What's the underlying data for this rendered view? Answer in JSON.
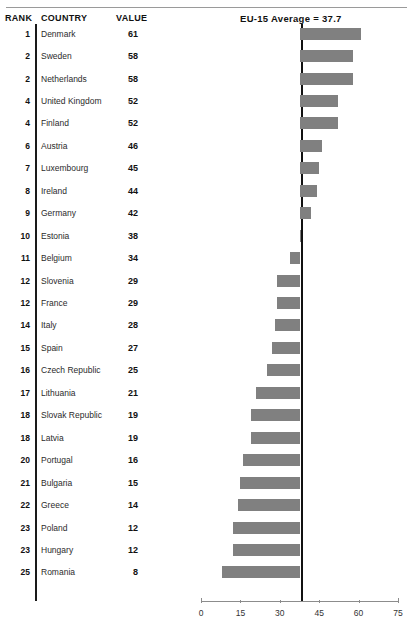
{
  "table": {
    "headers": {
      "rank": "RANK",
      "country": "COUNTRY",
      "value": "VALUE"
    }
  },
  "annotation": {
    "average_label": "EU-15 Average = 37.7"
  },
  "chart_data": {
    "type": "bar",
    "orientation": "horizontal",
    "title": "",
    "subtitle": "",
    "xlabel": "",
    "ylabel": "",
    "xlim": [
      0,
      75
    ],
    "xticks": [
      0,
      15,
      30,
      45,
      60,
      75
    ],
    "xtick_labels": [
      "0",
      "15",
      "30",
      "45",
      "60",
      "75"
    ],
    "grid": false,
    "legend": false,
    "bar_color": "#808080",
    "reference_line": {
      "label": "EU-15 Average = 37.7",
      "value": 37.7,
      "color": "#111111"
    },
    "bars_anchored_at_reference_line": true,
    "categories": [
      "Denmark",
      "Sweden",
      "Netherlands",
      "United Kingdom",
      "Finland",
      "Austria",
      "Luxembourg",
      "Ireland",
      "Germany",
      "Estonia",
      "Belgium",
      "Slovenia",
      "France",
      "Italy",
      "Spain",
      "Czech Republic",
      "Lithuania",
      "Slovak Republic",
      "Latvia",
      "Portugal",
      "Bulgaria",
      "Greece",
      "Poland",
      "Hungary",
      "Romania"
    ],
    "values": [
      61,
      58,
      58,
      52,
      52,
      46,
      45,
      44,
      42,
      38,
      34,
      29,
      29,
      28,
      27,
      25,
      21,
      19,
      19,
      16,
      15,
      14,
      12,
      12,
      8
    ],
    "ranks": [
      1,
      2,
      2,
      4,
      4,
      6,
      7,
      8,
      9,
      10,
      11,
      12,
      12,
      14,
      15,
      16,
      17,
      18,
      18,
      20,
      21,
      22,
      23,
      23,
      25
    ],
    "rows": [
      {
        "rank": "1",
        "country": "Denmark",
        "value": "61"
      },
      {
        "rank": "2",
        "country": "Sweden",
        "value": "58"
      },
      {
        "rank": "2",
        "country": "Netherlands",
        "value": "58"
      },
      {
        "rank": "4",
        "country": "United Kingdom",
        "value": "52"
      },
      {
        "rank": "4",
        "country": "Finland",
        "value": "52"
      },
      {
        "rank": "6",
        "country": "Austria",
        "value": "46"
      },
      {
        "rank": "7",
        "country": "Luxembourg",
        "value": "45"
      },
      {
        "rank": "8",
        "country": "Ireland",
        "value": "44"
      },
      {
        "rank": "9",
        "country": "Germany",
        "value": "42"
      },
      {
        "rank": "10",
        "country": "Estonia",
        "value": "38"
      },
      {
        "rank": "11",
        "country": "Belgium",
        "value": "34"
      },
      {
        "rank": "12",
        "country": "Slovenia",
        "value": "29"
      },
      {
        "rank": "12",
        "country": "France",
        "value": "29"
      },
      {
        "rank": "14",
        "country": "Italy",
        "value": "28"
      },
      {
        "rank": "15",
        "country": "Spain",
        "value": "27"
      },
      {
        "rank": "16",
        "country": "Czech Republic",
        "value": "25"
      },
      {
        "rank": "17",
        "country": "Lithuania",
        "value": "21"
      },
      {
        "rank": "18",
        "country": "Slovak Republic",
        "value": "19"
      },
      {
        "rank": "18",
        "country": "Latvia",
        "value": "19"
      },
      {
        "rank": "20",
        "country": "Portugal",
        "value": "16"
      },
      {
        "rank": "21",
        "country": "Bulgaria",
        "value": "15"
      },
      {
        "rank": "22",
        "country": "Greece",
        "value": "14"
      },
      {
        "rank": "23",
        "country": "Poland",
        "value": "12"
      },
      {
        "rank": "23",
        "country": "Hungary",
        "value": "12"
      },
      {
        "rank": "25",
        "country": "Romania",
        "value": "8"
      }
    ]
  }
}
